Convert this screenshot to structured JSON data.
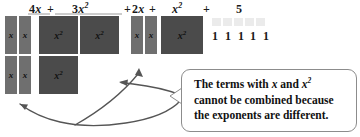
{
  "figure": {
    "background_color": "#ffffff",
    "colors": {
      "x_tile": "#6f6f6f",
      "x2_tile": "#4b4b4b",
      "one_tile": "#ebebeb",
      "underline": "#9a9a9a",
      "callout_border": "#8c8c8c",
      "arrow": "#555555",
      "text": "#111111"
    }
  },
  "expression": {
    "terms": [
      {
        "id": "term-4x",
        "label": "4x",
        "coefficient": "4",
        "variable": "x",
        "exponent": "",
        "operator_after": "+"
      },
      {
        "id": "term-3x2",
        "label": "3x2",
        "coefficient": "3",
        "variable": "x",
        "exponent": "2",
        "operator_after": "+"
      },
      {
        "id": "term-2x",
        "label": "2x",
        "coefficient": "2",
        "variable": "x",
        "exponent": "",
        "operator_after": "+"
      },
      {
        "id": "term-x2",
        "label": "x2",
        "coefficient": "",
        "variable": "x",
        "exponent": "2",
        "operator_after": "+"
      },
      {
        "id": "term-5",
        "label": "5",
        "coefficient": "5",
        "variable": "",
        "exponent": "",
        "operator_after": ""
      }
    ],
    "labels": {
      "coef_4": "4",
      "coef_3": "3",
      "coef_2": "2",
      "var_x": "x",
      "exp_2": "2",
      "constant_5": "5",
      "plus": "+"
    }
  },
  "tiles": {
    "x_tile_label": "x",
    "x2_tile_base": "x",
    "x2_tile_exponent": "2",
    "one_tile_label": "1",
    "groups": [
      {
        "name": "group-4x",
        "kind": "x",
        "count": 4,
        "arrangement": "2 columns x 2 rows"
      },
      {
        "name": "group-3x2",
        "kind": "x2",
        "count": 3,
        "arrangement": "2 on top row, 1 on second row"
      },
      {
        "name": "group-2x",
        "kind": "x",
        "count": 2,
        "arrangement": "2 columns x 1 row"
      },
      {
        "name": "group-x2",
        "kind": "x2",
        "count": 1,
        "arrangement": "single square"
      },
      {
        "name": "group-5",
        "kind": "one",
        "count": 5,
        "arrangement": "5 in a row"
      }
    ],
    "ones_row": [
      "1",
      "1",
      "1",
      "1",
      "1"
    ]
  },
  "callout": {
    "lines": [
      {
        "pre": "The terms with ",
        "var1": "x",
        "mid": " and ",
        "var2": "x",
        "exp2": "2",
        "post": ""
      },
      {
        "text": "cannot be combined because"
      },
      {
        "text": "the exponents are different."
      }
    ],
    "full_text": "The terms with x and x2 cannot be combined because the exponents are different."
  },
  "annotations": {
    "arrows": [
      {
        "name": "arrow-to-x-tiles",
        "points_to": "group-4x",
        "direction": "up-left"
      },
      {
        "name": "arrow-to-x2-tile",
        "points_to": "group-2x-area",
        "direction": "left"
      },
      {
        "name": "arrow-up",
        "points_to": "group-2x",
        "direction": "up"
      }
    ]
  }
}
